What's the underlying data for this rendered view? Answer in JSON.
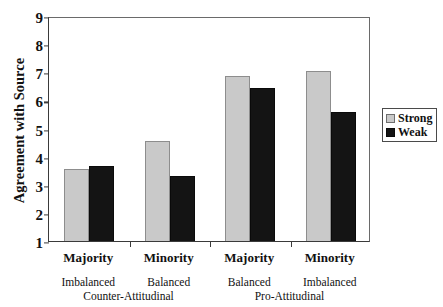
{
  "chart_data": {
    "type": "bar",
    "title": "",
    "xlabel": "",
    "ylabel": "Agreement with Source",
    "ylim": [
      1,
      9
    ],
    "yticks": [
      1,
      2,
      3,
      4,
      5,
      6,
      7,
      8,
      9
    ],
    "grid": false,
    "legend_position": "right-outside",
    "categories": [
      "Majority",
      "Minority",
      "Majority",
      "Minority"
    ],
    "category_sublabels": [
      "Imbalanced",
      "Balanced",
      "Balanced",
      "Imbalanced"
    ],
    "group_spans": [
      {
        "label": "Counter-Attitudinal",
        "categories": [
          0,
          1
        ]
      },
      {
        "label": "Pro-Attitudinal",
        "categories": [
          2,
          3
        ]
      }
    ],
    "series": [
      {
        "name": "Strong",
        "color": "#c9c9c9",
        "values": [
          3.55,
          4.55,
          6.85,
          7.05
        ]
      },
      {
        "name": "Weak",
        "color": "#141414",
        "values": [
          3.65,
          3.3,
          6.45,
          5.6
        ]
      }
    ]
  },
  "legend": {
    "items": [
      {
        "label": "Strong",
        "swatch": "strong"
      },
      {
        "label": "Weak",
        "swatch": "weak"
      }
    ]
  }
}
